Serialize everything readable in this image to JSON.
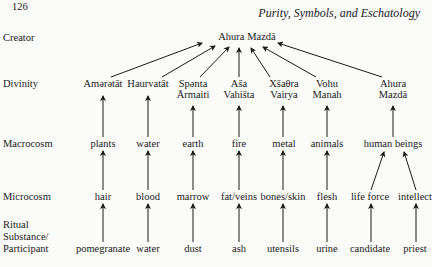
{
  "page": {
    "page_number": "126",
    "running_head": "Purity, Symbols, and Eschatology"
  },
  "row_labels": {
    "creator": "Creator",
    "divinity": "Divinity",
    "macrocosm": "Macrocosm",
    "microcosm": "Microcosm",
    "ritual_1": "Ritual",
    "ritual_2": "Substance/",
    "ritual_3": "Participant"
  },
  "creator": "Ahura Mazdā",
  "divinities": [
    {
      "line1": "Amərətāt",
      "line2": ""
    },
    {
      "line1": "Haurvatāt",
      "line2": ""
    },
    {
      "line1": "Spənta",
      "line2": "Ārmaiti"
    },
    {
      "line1": "Aša",
      "line2": "Vahišta"
    },
    {
      "line1": "Xšaθra",
      "line2": "Vairya"
    },
    {
      "line1": "Vohu",
      "line2": "Manah"
    },
    {
      "line1": "Ahura",
      "line2": "Mazdā"
    }
  ],
  "macrocosm": [
    "plants",
    "water",
    "earth",
    "fire",
    "metal",
    "animals",
    "human beings"
  ],
  "microcosm": [
    "hair",
    "blood",
    "marrow",
    "fat/veins",
    "bones/skin",
    "flesh",
    "life force",
    "intellect"
  ],
  "ritual": [
    "pomegranate",
    "water",
    "dust",
    "ash",
    "utensils",
    "urine",
    "candidate",
    "priest"
  ]
}
